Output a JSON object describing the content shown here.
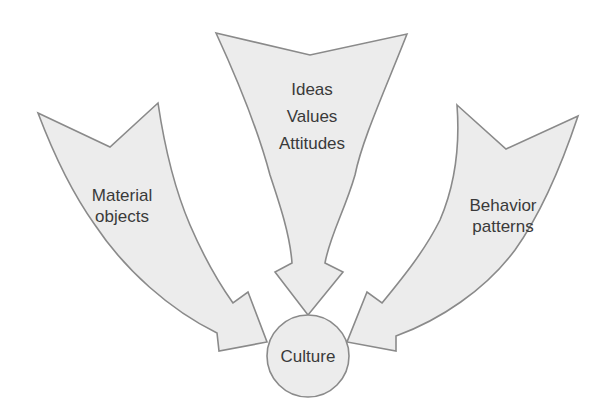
{
  "diagram": {
    "type": "converging-arrows",
    "center_node": {
      "label": "Culture"
    },
    "inputs": [
      {
        "id": "left",
        "lines": [
          "Material",
          "objects"
        ]
      },
      {
        "id": "top",
        "lines": [
          "Ideas",
          "Values",
          "Attitudes"
        ]
      },
      {
        "id": "right",
        "lines": [
          "Behavior",
          "patterns"
        ]
      }
    ],
    "colors": {
      "fill": "#ececec",
      "stroke": "#8a8a8a",
      "text": "#3a3a3a",
      "background": "#ffffff"
    }
  }
}
